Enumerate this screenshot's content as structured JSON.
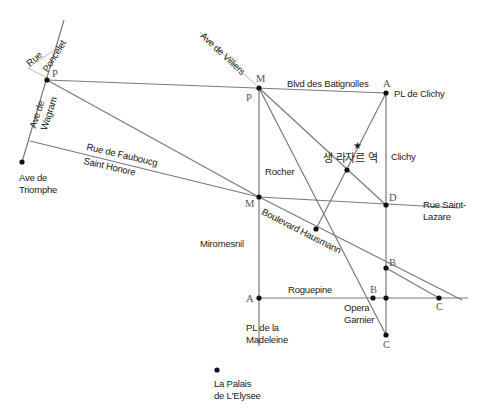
{
  "map": {
    "colors": {
      "road": "#7a7a7a",
      "light_road": "#bbbbbb",
      "point": "#111111",
      "text": "#222222",
      "point_label": "#555555"
    },
    "streets": {
      "rue_poncelet": [
        "Rue",
        "Poncelet"
      ],
      "ave_wagram": [
        "Ave de",
        "Wagram"
      ],
      "ave_villiers": "Ave de Villiers",
      "blvd_batignolles": "Blvd des Batignolles",
      "rue_faubourg": [
        "Rue de Faubоucg",
        "Saint Honore"
      ],
      "boulevard_hausmann": "Boulevard Hausmann",
      "rue_saint_lazare": [
        "Rue Saint-",
        "Lazare"
      ],
      "roguepine": "Roguepine"
    },
    "places": {
      "ave_triomphe": [
        "Ave de",
        "Triomphe"
      ],
      "pl_clichy": "PL de Clichy",
      "clichy": "Clichy",
      "rocher": "Rocher",
      "saint_lazare_station": "생 라자르 역",
      "miromesnil": "Miromesnil",
      "opera_garnier": [
        "Opera",
        "Garnier"
      ],
      "pl_madeleine": [
        "PL de la",
        "Madeleine"
      ],
      "palais_elysee": [
        "La Palais",
        "de L'Elysee"
      ]
    },
    "points": {
      "p_top_left": "P",
      "m_top": "M",
      "p_top": "P",
      "a_top": "A",
      "d": "D",
      "m_mid": "M",
      "b_right": "B",
      "a_bottom": "A",
      "b_opera": "B",
      "c_right": "C",
      "c_bottom": "C"
    },
    "markers": {
      "station_star": "★"
    }
  }
}
